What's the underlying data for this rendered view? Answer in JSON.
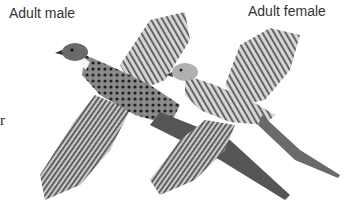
{
  "labels": {
    "male": "Adult male",
    "female": "Adult female",
    "edge_fragment": "r"
  },
  "illustration": {
    "subject": "two flying pheasants (male and female), grayscale engraving",
    "colors": {
      "background": "#ffffff",
      "ink_dark": "#2a2a2a",
      "ink_mid": "#6e6e6e",
      "ink_light": "#b5b5b5"
    }
  }
}
